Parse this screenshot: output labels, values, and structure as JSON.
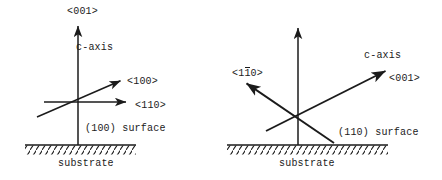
{
  "figure": {
    "background_color": "#ffffff",
    "ink_color": "#1b1b1b",
    "width": 442,
    "height": 180
  },
  "panels": [
    {
      "id": "panel-left",
      "surface_plane": "(100)",
      "labels": {
        "vertical_axis": "<001>",
        "c_axis": "c-axis",
        "diagonal_axis": "<100>",
        "horizontal_axis": "<110>",
        "surface": "(100) surface",
        "substrate": "substrate"
      },
      "geometry": {
        "origin": [
          78,
          102
        ],
        "vertical_arrow_tip": [
          78,
          22
        ],
        "vertical_arrow_base": [
          78,
          145
        ],
        "horizontal_arrow_tip": [
          130,
          102
        ],
        "horizontal_arrow_base": [
          44,
          102
        ],
        "diagonal_arrow_tip": [
          124,
          79
        ],
        "diagonal_arrow_base": [
          37,
          117
        ],
        "hatch_line_y": 145,
        "hatch_x_start": 25,
        "hatch_x_end": 136
      }
    },
    {
      "id": "panel-right",
      "surface_plane": "(110)",
      "labels": {
        "c_axis": "c-axis",
        "c_axis_direction": "<001>",
        "in_plane_axis_pre": "<1",
        "in_plane_axis_bar": "1",
        "in_plane_axis_post": "0>",
        "in_plane_axis_full": "<1̅1̅0>",
        "surface": "(110) surface",
        "substrate": "substrate"
      },
      "geometry": {
        "origin": [
          77,
          113
        ],
        "vertical_arrow_tip": [
          77,
          24
        ],
        "vertical_arrow_base": [
          77,
          145
        ],
        "c_axis_arrow_tip": [
          168,
          69
        ],
        "c_axis_arrow_base": [
          45,
          131
        ],
        "in_plane_arrow_tip": [
          22,
          81
        ],
        "in_plane_arrow_base": [
          113,
          143
        ],
        "hatch_line_y": 145,
        "hatch_x_start": 6,
        "hatch_x_end": 167
      }
    }
  ]
}
